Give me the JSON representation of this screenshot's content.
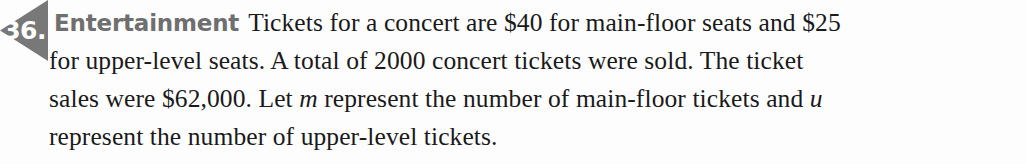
{
  "exercise": {
    "number_label": "36.",
    "badge_color": "#787878",
    "badge_text_color": "#ffffff",
    "category_label": "Entertainment",
    "category_color": "#6f6f6f",
    "body_color": "#1a1a1a",
    "background_color": "#fdfdfd",
    "lines": [
      {
        "prefix": "Tickets for a concert are $40 for main-floor seats and $25",
        "text": ""
      },
      {
        "text": "for upper-level seats. A total of 2000 concert tickets were sold. The ticket"
      },
      {
        "before_var": "sales were $62,000. Let ",
        "var": "m",
        "after_var": " represent the number of main-floor tickets and ",
        "var2": "u"
      },
      {
        "text": "represent the number of upper-level tickets."
      }
    ],
    "full_text": "36. Entertainment Tickets for a concert are $40 for main-floor seats and $25 for upper-level seats. A total of 2000 concert tickets were sold. The ticket sales were $62,000. Let m represent the number of main-floor tickets and u represent the number of upper-level tickets."
  }
}
